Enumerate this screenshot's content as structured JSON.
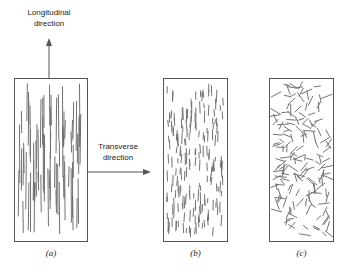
{
  "figure": {
    "background_color": "#ffffff",
    "fiber_color": "#6e6e6e",
    "border_color": "#555555",
    "text_color": "#1a1a1a"
  },
  "annotations": {
    "longitudinal": {
      "line1": "Longitudinal",
      "line2": "direction",
      "arrow_name": "longitudinal-direction-arrow",
      "arrow_orientation": "up"
    },
    "transverse": {
      "line1": "Transverse",
      "line2": "direction",
      "arrow_name": "transverse-direction-arrow",
      "arrow_orientation": "right"
    }
  },
  "panels": [
    {
      "caption": "(a)",
      "name": "panel-a-continuous-aligned",
      "description": "continuous aligned fibers",
      "fiber_style": "long-vertical",
      "x": 14,
      "y": 78,
      "width": 74,
      "height": 164
    },
    {
      "caption": "(b)",
      "name": "panel-b-discontinuous-aligned",
      "description": "discontinuous aligned fibers",
      "fiber_style": "short-vertical",
      "x": 163,
      "y": 78,
      "width": 65,
      "height": 164
    },
    {
      "caption": "(c)",
      "name": "panel-c-discontinuous-random",
      "description": "discontinuous randomly oriented fibers",
      "fiber_style": "short-random",
      "x": 269,
      "y": 78,
      "width": 65,
      "height": 164
    }
  ],
  "chart_data": {
    "type": "diagram",
    "title": "",
    "panel_count": 3,
    "panel_fiber_counts": [
      72,
      190,
      165
    ]
  }
}
